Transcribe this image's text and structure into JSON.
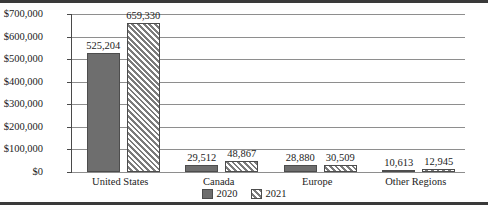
{
  "chart_data": {
    "type": "bar",
    "title": "",
    "subtitle": "",
    "xlabel": "",
    "ylabel": "",
    "categories": [
      "United States",
      "Canada",
      "Europe",
      "Other Regions"
    ],
    "series": [
      {
        "name": "2020",
        "values": [
          525204,
          29512,
          28880,
          10613
        ],
        "labels": [
          "525,204",
          "29,512",
          "28,880",
          "10,613"
        ],
        "fill": "solid",
        "color": "#6e6e6e"
      },
      {
        "name": "2021",
        "values": [
          659330,
          48867,
          30509,
          12945
        ],
        "labels": [
          "659,330",
          "48,867",
          "30,509",
          "12,945"
        ],
        "fill": "diagonal-hatch",
        "color": "#d8d8d8"
      }
    ],
    "ylim": [
      0,
      700000
    ],
    "yticks": [
      0,
      100000,
      200000,
      300000,
      400000,
      500000,
      600000,
      700000
    ],
    "ytick_labels": [
      "$0",
      "$100,000",
      "$200,000",
      "$300,000",
      "$400,000",
      "$500,000",
      "$600,000",
      "$700,000"
    ],
    "grid": "horizontal",
    "legend_position": "bottom-center",
    "legend_entries": [
      "2020",
      "2021"
    ],
    "data_labels_shown": true
  }
}
